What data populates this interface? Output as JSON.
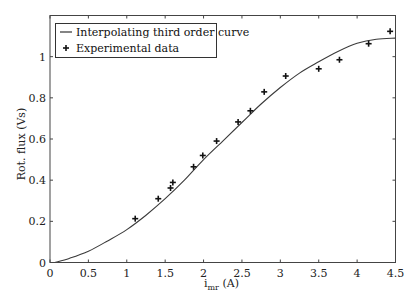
{
  "chart_data": {
    "type": "line",
    "title": "",
    "xlabel": "i_mr (A)",
    "xlabel_main": "i",
    "xlabel_sub": "mr",
    "xlabel_unit": " (A)",
    "ylabel": "Rot. flux (Vs)",
    "xlim": [
      0,
      4.5
    ],
    "ylim": [
      0,
      1.2
    ],
    "xticks": [
      0,
      0.5,
      1,
      1.5,
      2,
      2.5,
      3,
      3.5,
      4,
      4.5
    ],
    "xtick_labels": [
      "0",
      "0.5",
      "1",
      "1.5",
      "2",
      "2.5",
      "3",
      "3.5",
      "4",
      "4.5"
    ],
    "yticks": [
      0,
      0.2,
      0.4,
      0.6,
      0.8,
      1
    ],
    "ytick_labels": [
      "0",
      "0.2",
      "0.4",
      "0.6",
      "0.8",
      "1"
    ],
    "grid": false,
    "legend_position": "upper left",
    "series": [
      {
        "name": "Interpolating third order curve",
        "type": "line",
        "color": "#333333",
        "x": [
          0.06,
          0.25,
          0.5,
          0.75,
          1.0,
          1.25,
          1.5,
          1.75,
          2.0,
          2.25,
          2.5,
          2.75,
          3.0,
          3.25,
          3.5,
          3.75,
          4.0,
          4.25,
          4.5
        ],
        "y": [
          0.0,
          0.02,
          0.055,
          0.105,
          0.16,
          0.23,
          0.31,
          0.4,
          0.5,
          0.59,
          0.68,
          0.77,
          0.85,
          0.92,
          0.975,
          1.025,
          1.065,
          1.085,
          1.09
        ]
      },
      {
        "name": "Experimental data",
        "type": "scatter",
        "marker": "+",
        "color": "#111111",
        "x": [
          1.11,
          1.41,
          1.57,
          1.6,
          1.87,
          1.99,
          2.17,
          2.45,
          2.61,
          2.79,
          3.07,
          3.5,
          3.77,
          4.15,
          4.43
        ],
        "y": [
          0.213,
          0.31,
          0.362,
          0.389,
          0.465,
          0.52,
          0.59,
          0.683,
          0.737,
          0.829,
          0.906,
          0.941,
          0.985,
          1.063,
          1.123
        ]
      }
    ]
  },
  "legend": {
    "items": [
      {
        "label": "Interpolating third order curve",
        "symbol": "line"
      },
      {
        "label": "Experimental data",
        "symbol": "plus"
      }
    ]
  }
}
